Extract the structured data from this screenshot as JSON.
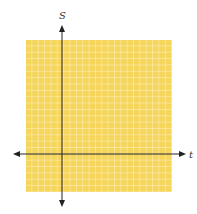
{
  "diagram": {
    "type": "blank coordinate grid",
    "x_axis_label": "t",
    "y_axis_label": "S",
    "grid_color": "#f5d55c",
    "grid_line_color": "#ffffff",
    "axis_color": "#222222",
    "columns": 23,
    "rows": 24
  }
}
